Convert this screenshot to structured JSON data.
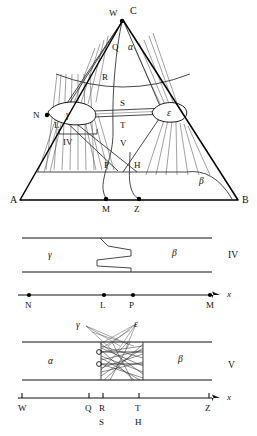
{
  "figure": {
    "caption": "Ternary phase diagram with isopleth sections IV and V",
    "colors": {
      "ink": "#000000",
      "line_mid": "#333333",
      "line_thin": "#555555",
      "background": "#ffffff"
    }
  },
  "ternary": {
    "name": "ternary-phase-triangle",
    "vertices": {
      "left": "A",
      "right": "B",
      "apex": "C"
    },
    "phase_labels": {
      "alpha": "α",
      "beta": "β",
      "gamma": "γ",
      "epsilon": "ε"
    },
    "point_labels": [
      "W",
      "Q",
      "R",
      "S",
      "T",
      "V",
      "N",
      "L",
      "P",
      "H",
      "M",
      "Z"
    ],
    "section_marker": "IV",
    "marked_points": [
      "W",
      "N",
      "M",
      "Z"
    ]
  },
  "section_iv": {
    "name": "section-iv",
    "title": "IV",
    "left_phase": "γ",
    "right_phase": "β",
    "axis_label": "x",
    "ticks": [
      {
        "label": "N",
        "x": 0.0
      },
      {
        "label": "L",
        "x": 0.46
      },
      {
        "label": "P",
        "x": 0.6
      },
      {
        "label": "M",
        "x": 1.0
      }
    ]
  },
  "section_v": {
    "name": "section-v",
    "title": "V",
    "left_phase": "α",
    "right_phase": "β",
    "upper_phases": [
      "γ",
      "ε"
    ],
    "axis_label": "x",
    "ticks": [
      {
        "label": "W",
        "sublabel": "",
        "x": 0.0
      },
      {
        "label": "Q",
        "sublabel": "",
        "x": 0.37
      },
      {
        "label": "R",
        "sublabel": "S",
        "x": 0.45
      },
      {
        "label": "T",
        "sublabel": "H",
        "x": 0.62
      },
      {
        "label": "Z",
        "sublabel": "",
        "x": 1.0
      }
    ]
  }
}
